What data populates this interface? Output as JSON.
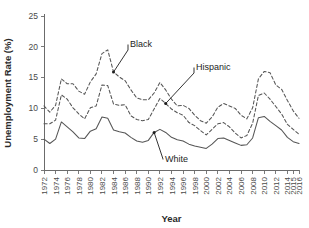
{
  "chart_data": {
    "type": "line",
    "title": "",
    "xlabel": "Year",
    "ylabel": "Unemployment Rate (%)",
    "xlim": [
      1972,
      2016
    ],
    "ylim": [
      0,
      25
    ],
    "ytick_labels": [
      "0",
      "5",
      "10",
      "15",
      "20",
      "25"
    ],
    "yticks": [
      0,
      5,
      10,
      15,
      20,
      25
    ],
    "xtick_labels": [
      "1972",
      "1974",
      "1976",
      "1978",
      "1980",
      "1982",
      "1984",
      "1986",
      "1988",
      "1990",
      "1992",
      "1994",
      "1996",
      "1998",
      "2000",
      "2002",
      "2004",
      "2006",
      "2008",
      "2010",
      "2012",
      "2014",
      "2015",
      "2016"
    ],
    "xticks": [
      1972,
      1974,
      1976,
      1978,
      1980,
      1982,
      1984,
      1986,
      1988,
      1990,
      1992,
      1994,
      1996,
      1998,
      2000,
      2002,
      2004,
      2006,
      2008,
      2010,
      2012,
      2014,
      2015,
      2016
    ],
    "grid": false,
    "legend_position": "inline-annotations",
    "x": [
      1972,
      1973,
      1974,
      1975,
      1976,
      1977,
      1978,
      1979,
      1980,
      1981,
      1982,
      1983,
      1984,
      1985,
      1986,
      1987,
      1988,
      1989,
      1990,
      1991,
      1992,
      1993,
      1994,
      1995,
      1996,
      1997,
      1998,
      1999,
      2000,
      2001,
      2002,
      2003,
      2004,
      2005,
      2006,
      2007,
      2008,
      2009,
      2010,
      2011,
      2012,
      2013,
      2014,
      2015,
      2016
    ],
    "series": [
      {
        "name": "Black",
        "style": "dashed",
        "values": [
          10.4,
          9.4,
          10.5,
          14.8,
          14.0,
          14.0,
          12.8,
          12.3,
          14.3,
          15.6,
          18.9,
          19.5,
          15.9,
          15.1,
          14.5,
          13.0,
          11.7,
          11.4,
          11.4,
          12.5,
          14.2,
          13.0,
          11.5,
          10.4,
          10.5,
          10.0,
          8.9,
          8.0,
          7.6,
          8.6,
          10.2,
          10.8,
          10.4,
          10.0,
          8.9,
          8.3,
          10.1,
          14.8,
          16.0,
          15.8,
          13.8,
          13.1,
          11.3,
          9.6,
          8.4
        ]
      },
      {
        "name": "Hispanic",
        "style": "dashed",
        "values": [
          7.5,
          7.5,
          8.1,
          12.2,
          11.5,
          10.1,
          9.1,
          8.3,
          10.1,
          10.4,
          13.8,
          13.7,
          10.7,
          10.5,
          10.6,
          8.8,
          8.2,
          8.0,
          8.2,
          9.9,
          11.6,
          10.8,
          9.9,
          9.3,
          8.9,
          7.7,
          7.2,
          6.4,
          5.7,
          6.6,
          7.5,
          7.7,
          7.0,
          6.0,
          5.2,
          5.6,
          7.6,
          12.1,
          12.5,
          11.5,
          10.3,
          9.1,
          7.4,
          6.6,
          5.8
        ]
      },
      {
        "name": "White",
        "style": "solid",
        "values": [
          5.0,
          4.3,
          5.0,
          7.8,
          7.0,
          6.2,
          5.2,
          5.1,
          6.3,
          6.7,
          8.6,
          8.4,
          6.5,
          6.2,
          6.0,
          5.3,
          4.7,
          4.5,
          4.8,
          6.1,
          6.6,
          6.1,
          5.3,
          4.9,
          4.7,
          4.2,
          3.9,
          3.7,
          3.5,
          4.2,
          5.1,
          5.2,
          4.8,
          4.4,
          4.0,
          4.1,
          5.2,
          8.5,
          8.7,
          7.9,
          7.2,
          6.5,
          5.3,
          4.6,
          4.3
        ]
      }
    ],
    "annotations": [
      {
        "text": "Black",
        "series": "Black",
        "point_year": 1984,
        "point_value": 15.9
      },
      {
        "text": "Hispanic",
        "series": "Hispanic",
        "point_year": 1993,
        "point_value": 10.8
      },
      {
        "text": "White",
        "series": "White",
        "point_year": 1991,
        "point_value": 6.1
      }
    ]
  }
}
